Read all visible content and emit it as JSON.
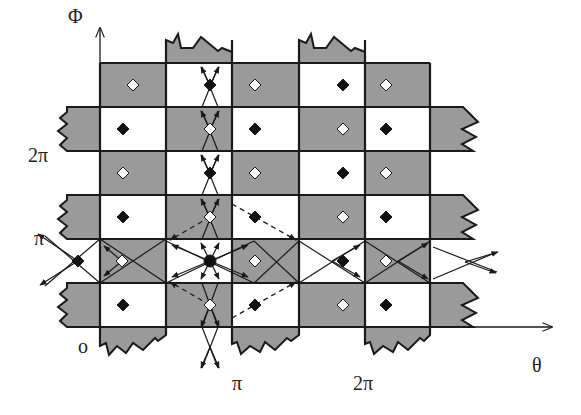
{
  "axes": {
    "x_label": "θ",
    "y_label": "Φ",
    "x_ticks": [
      "π",
      "2π"
    ],
    "y_ticks": [
      "π",
      "2π"
    ],
    "origin_label": "o"
  },
  "colors": {
    "shaded": "#9a9a9a",
    "unshaded": "#ffffff",
    "line": "#1a1a1a",
    "marker_filled": "#111111",
    "marker_open": "#ffffff"
  },
  "grid": {
    "columns_x": [
      100,
      166,
      232,
      299,
      365,
      430
    ],
    "rows_y": [
      63,
      107,
      151,
      195,
      239,
      283,
      327
    ]
  },
  "legend": {
    "filled_diamond": "filled diamond marker",
    "open_diamond": "open diamond marker",
    "central_node": "large filled dot at (π, π)"
  }
}
